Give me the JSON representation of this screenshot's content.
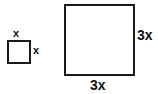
{
  "figure": {
    "type": "geometry-diagram",
    "background_color": "#ffffff",
    "stroke_color": "#1a1a1a",
    "text_color": "#121212",
    "shapes": [
      {
        "name": "small-square",
        "kind": "square",
        "side_label": "x",
        "labels": {
          "top": "x",
          "right": "x"
        }
      },
      {
        "name": "large-square",
        "kind": "square",
        "side_label": "3x",
        "labels": {
          "right": "3x",
          "bottom": "3x"
        }
      }
    ]
  }
}
